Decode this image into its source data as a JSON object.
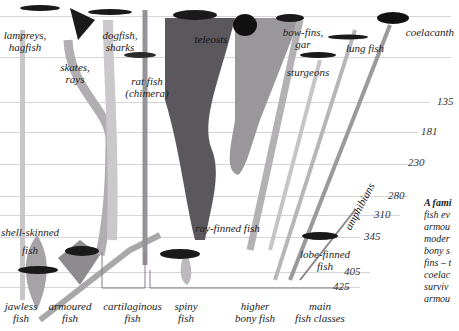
{
  "diagram": {
    "time_axis_ages_mya": [
      "135",
      "181",
      "230",
      "280",
      "310",
      "345",
      "405",
      "425"
    ],
    "groups_top": [
      {
        "id": "lampreys",
        "label": "lampreys,\nhagfish"
      },
      {
        "id": "skates",
        "label": "skates,\nrays"
      },
      {
        "id": "dogfish",
        "label": "dogfish,\nsharks"
      },
      {
        "id": "ratfish",
        "label": "rat fish\n(chimera)"
      },
      {
        "id": "teleosts",
        "label": "teleosts"
      },
      {
        "id": "bowfins",
        "label": "bow-fins,\ngar"
      },
      {
        "id": "sturgeons",
        "label": "sturgeons"
      },
      {
        "id": "lungfish",
        "label": "lung fish"
      },
      {
        "id": "coelacanth",
        "label": "coelacanth"
      },
      {
        "id": "amphibians",
        "label": "amphibians"
      }
    ],
    "groups_mid": [
      {
        "id": "shell",
        "label": "shell-skinned\nfish"
      },
      {
        "id": "rayfinned",
        "label": "ray-finned fish"
      },
      {
        "id": "lobefinned",
        "label": "lobe-finned\nfish"
      }
    ],
    "groups_bottom": [
      {
        "id": "jawless",
        "label": "jawless\nfish"
      },
      {
        "id": "armoured",
        "label": "armoured\nfish"
      },
      {
        "id": "cartilaginous",
        "label": "cartilaginous\nfish"
      },
      {
        "id": "spiny",
        "label": "spiny\nfish"
      },
      {
        "id": "higher",
        "label": "higher\nbony fish"
      },
      {
        "id": "main",
        "label": "main\nfish classes"
      }
    ],
    "caption": {
      "heading": "A fami",
      "lines": [
        "fish ev",
        "armou",
        "moder",
        "bony s",
        "fins – t",
        "coelac",
        "surviv",
        "armou"
      ]
    }
  }
}
